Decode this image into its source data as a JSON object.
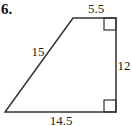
{
  "problem": {
    "number": "6.",
    "shape": "right trapezoid",
    "labels": {
      "top": "5.5",
      "slant": "15",
      "right": "12",
      "bottom": "14.5"
    },
    "right_angle_markers": [
      "top-right",
      "bottom-right"
    ]
  }
}
